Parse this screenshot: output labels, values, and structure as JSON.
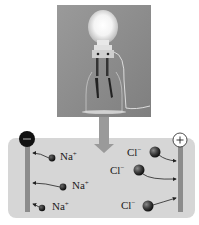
{
  "figure": {
    "photo": {
      "subject": "light-bulb-conductivity-apparatus",
      "bulb_state": "lit"
    },
    "arrow": {
      "direction": "down"
    },
    "solution_panel": {
      "electrodes": [
        {
          "sign": "−",
          "position": "left",
          "label": "negative-electrode"
        },
        {
          "sign": "+",
          "position": "right",
          "label": "positive-electrode"
        }
      ],
      "cations": [
        {
          "label": "Na",
          "charge": "+"
        },
        {
          "label": "Na",
          "charge": "+"
        },
        {
          "label": "Na",
          "charge": "+"
        }
      ],
      "anions": [
        {
          "label": "Cl",
          "charge": "−"
        },
        {
          "label": "Cl",
          "charge": "−"
        },
        {
          "label": "Cl",
          "charge": "−"
        }
      ]
    }
  },
  "colors": {
    "panel": "#d6d6d6",
    "electrode": "#8c8c8c",
    "negative_terminal": "#111111",
    "positive_terminal": "#ffffff",
    "ion": "#2a2a2a",
    "arrow": "#9a9a9a",
    "photo_bg": "#8f8f8f"
  }
}
